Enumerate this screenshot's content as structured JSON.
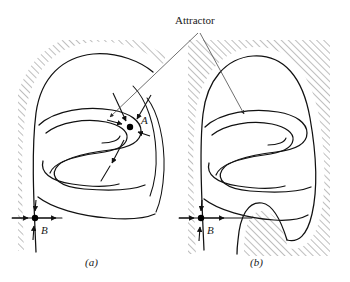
{
  "figure": {
    "title_annotation": "Attractor",
    "panels": [
      {
        "id": "a",
        "caption": "(a)",
        "points": [
          {
            "name": "A",
            "label": "A",
            "x": 130,
            "y": 127,
            "type": "saddle-point"
          },
          {
            "name": "B",
            "label": "B",
            "x": 35,
            "y": 218,
            "type": "saddle-point"
          }
        ]
      },
      {
        "id": "b",
        "caption": "(b)",
        "points": [
          {
            "name": "B",
            "label": "B",
            "x": 201,
            "y": 218,
            "type": "saddle-point"
          }
        ]
      }
    ],
    "colors": {
      "stroke": "#111111",
      "hatch": "#6f6f6f",
      "leader": "#4a4a4a",
      "background": "#ffffff"
    },
    "icon_names": [
      "arrowhead-icon",
      "hatching-icon",
      "saddle-point-dot-icon"
    ]
  }
}
